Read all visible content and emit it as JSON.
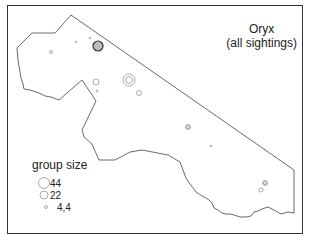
{
  "title": {
    "line1": "Oryx",
    "line2": "(all sightings)"
  },
  "legend": {
    "title": "group size",
    "items": [
      {
        "label": "44",
        "radius": 5.5
      },
      {
        "label": "22",
        "radius": 4
      },
      {
        "label": "4,4",
        "radius": 1.5
      }
    ]
  },
  "colors": {
    "outline": "#444444",
    "circle": "#888888",
    "frame": "#333333"
  },
  "sightings": [
    {
      "x": 98,
      "y": 46,
      "r": 5,
      "dense": true
    },
    {
      "x": 51,
      "y": 52,
      "r": 1.5
    },
    {
      "x": 76,
      "y": 42,
      "r": 0.8
    },
    {
      "x": 90,
      "y": 38,
      "r": 0.8
    },
    {
      "x": 129,
      "y": 80,
      "r": 6
    },
    {
      "x": 129,
      "y": 80,
      "r": 3.5
    },
    {
      "x": 96,
      "y": 82,
      "r": 3
    },
    {
      "x": 97,
      "y": 91,
      "r": 1
    },
    {
      "x": 139,
      "y": 93,
      "r": 2.5
    },
    {
      "x": 188,
      "y": 127,
      "r": 2.5
    },
    {
      "x": 188,
      "y": 127,
      "r": 1.5
    },
    {
      "x": 211,
      "y": 146,
      "r": 0.8
    },
    {
      "x": 265,
      "y": 183,
      "r": 2.5
    },
    {
      "x": 265,
      "y": 183,
      "r": 1.5
    },
    {
      "x": 261,
      "y": 190,
      "r": 2
    }
  ]
}
